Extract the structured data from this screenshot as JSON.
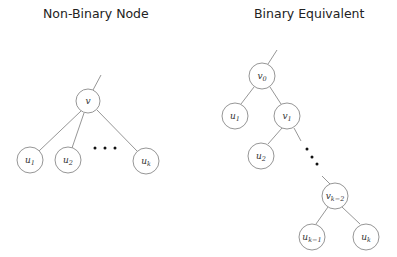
{
  "left": {
    "title": "Non-Binary Node",
    "root": {
      "label": "v"
    },
    "children": [
      {
        "base": "u",
        "sub": "1"
      },
      {
        "base": "u",
        "sub": "2"
      },
      {
        "base": "u",
        "sub": "k"
      }
    ],
    "ellipsis": "• • •"
  },
  "right": {
    "title": "Binary Equivalent",
    "nodes": [
      {
        "base": "v",
        "sub": "0"
      },
      {
        "base": "u",
        "sub": "1"
      },
      {
        "base": "v",
        "sub": "1"
      },
      {
        "base": "u",
        "sub": "2"
      },
      {
        "base": "v",
        "sub": "k−2"
      },
      {
        "base": "u",
        "sub": "k−1"
      },
      {
        "base": "u",
        "sub": "k"
      }
    ]
  }
}
